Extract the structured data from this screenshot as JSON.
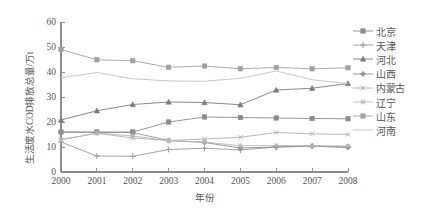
{
  "chart_data": {
    "type": "line",
    "title": "",
    "xlabel": "年份",
    "ylabel": "生活废水COD排放总量/万t",
    "x": [
      2000,
      2001,
      2002,
      2003,
      2004,
      2005,
      2006,
      2007,
      2008
    ],
    "xticklabels": [
      "2000",
      "2001",
      "2002",
      "2003",
      "2004",
      "2005",
      "2006",
      "2007",
      "2008"
    ],
    "yticklabels": [
      "0",
      "10",
      "20",
      "30",
      "40",
      "50",
      "60"
    ],
    "yticks": [
      0,
      10,
      20,
      30,
      40,
      50,
      60
    ],
    "ylim": [
      0,
      60
    ],
    "xlim": [
      2000,
      2008
    ],
    "grid": false,
    "legend_position": "right",
    "series": [
      {
        "name": "北京",
        "marker": "square",
        "color": "#8a8a8a",
        "values": [
          16.0,
          16.0,
          16.0,
          20.0,
          22.0,
          21.8,
          21.6,
          21.4,
          21.3
        ]
      },
      {
        "name": "天津",
        "marker": "plus",
        "color": "#9a9a9a",
        "values": [
          12.0,
          6.4,
          6.3,
          9.0,
          9.5,
          8.8,
          10.0,
          10.5,
          10.0
        ]
      },
      {
        "name": "河北",
        "marker": "triangle",
        "color": "#7d7d7d",
        "values": [
          20.8,
          24.5,
          27.0,
          28.0,
          27.8,
          26.9,
          32.8,
          33.5,
          35.4
        ]
      },
      {
        "name": "山西",
        "marker": "diamond",
        "color": "#8f8f8f",
        "values": [
          16.0,
          15.8,
          15.8,
          12.6,
          11.8,
          9.6,
          10.0,
          10.3,
          9.8
        ]
      },
      {
        "name": "内蒙古",
        "marker": "x",
        "color": "#b0b0b0",
        "values": [
          12.8,
          15.5,
          13.6,
          12.6,
          13.2,
          13.9,
          15.8,
          15.3,
          15.0
        ]
      },
      {
        "name": "辽宁",
        "marker": "star",
        "color": "#b8b8b8",
        "values": [
          13.0,
          15.6,
          14.4,
          12.5,
          12.0,
          10.5,
          10.6,
          10.5,
          10.4
        ]
      },
      {
        "name": "山东",
        "marker": "square",
        "color": "#a0a0a0",
        "values": [
          49.0,
          44.9,
          44.5,
          41.9,
          42.4,
          41.3,
          41.8,
          41.3,
          41.7
        ]
      },
      {
        "name": "河南",
        "marker": "none",
        "color": "#c2c2c2",
        "values": [
          37.7,
          39.8,
          37.3,
          36.4,
          36.3,
          37.5,
          40.4,
          36.9,
          35.4
        ]
      }
    ]
  },
  "axes": {
    "axis_color": "#8d8d8d",
    "tick_color": "#8d8d8d"
  }
}
